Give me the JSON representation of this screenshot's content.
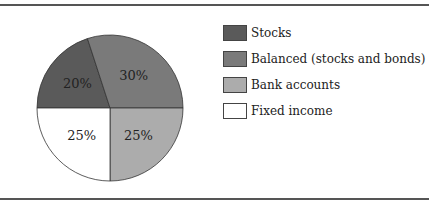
{
  "chart_data": {
    "type": "pie",
    "title": "",
    "categories": [
      "Stocks",
      "Balanced (stocks and bonds)",
      "Bank accounts",
      "Fixed income"
    ],
    "values": [
      20,
      30,
      25,
      25
    ],
    "labels": [
      "20%",
      "30%",
      "25%",
      "25%"
    ],
    "colors": [
      "#5a5a5a",
      "#7a7a7a",
      "#acacac",
      "#ffffff"
    ],
    "legend_position": "right"
  }
}
